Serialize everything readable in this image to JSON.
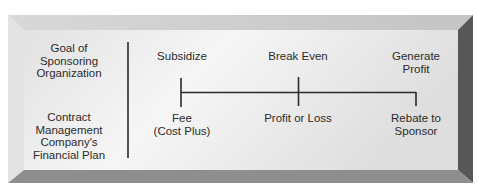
{
  "diagram": {
    "row_labels": {
      "top": [
        "Goal of",
        "Sponsoring",
        "Organization"
      ],
      "bottom": [
        "Contract",
        "Management",
        "Company's",
        "Financial Plan"
      ]
    },
    "goals": [
      {
        "lines": [
          "Subsidize"
        ]
      },
      {
        "lines": [
          "Break Even"
        ]
      },
      {
        "lines": [
          "Generate",
          "Profit"
        ]
      }
    ],
    "plans": [
      {
        "lines": [
          "Fee",
          "(Cost Plus)"
        ]
      },
      {
        "lines": [
          "Profit or Loss"
        ]
      },
      {
        "lines": [
          "Rebate to",
          "Sponsor"
        ]
      }
    ],
    "colors": {
      "face_light": "#f4f4f4",
      "face_dark": "#d6d6d6",
      "bevel_top": "#c9c9c9",
      "bevel_left": "#e0e0e0",
      "bevel_right": "#5a5a5a",
      "bevel_bottom": "#8f8f8f",
      "line": "#2a2a2a"
    }
  }
}
